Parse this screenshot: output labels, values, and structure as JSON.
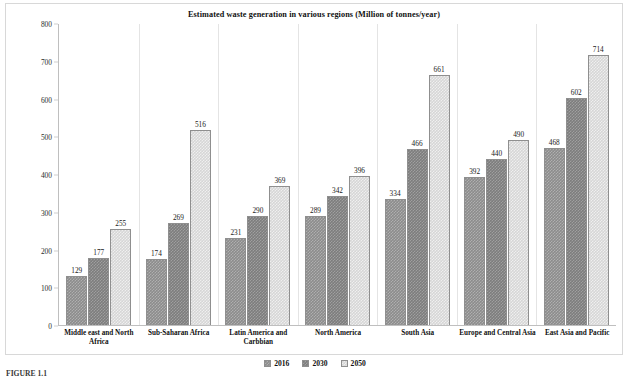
{
  "caption": "FIGURE 1.1",
  "legend": {
    "position": "bottom-center",
    "entries": [
      {
        "label": "2016",
        "color": "#8c8c8c"
      },
      {
        "label": "2030",
        "color": "#7d7d7d"
      },
      {
        "label": "2050",
        "color": "#d6d6d6"
      }
    ]
  },
  "chart_data": {
    "type": "bar",
    "title": "Estimated waste generation in various regions (Million of tonnes/year)",
    "xlabel": "",
    "ylabel": "Million of tonnes/year",
    "ylim": [
      0,
      800
    ],
    "yticks": [
      0,
      100,
      200,
      300,
      400,
      500,
      600,
      700,
      800
    ],
    "grid": false,
    "categories": [
      "Middle east and North Africa",
      "Sub-Saharan Africa",
      "Latin America and Carbbian",
      "North America",
      "South Asia",
      "Europe and Central Asia",
      "East Asia and Pacific"
    ],
    "series": [
      {
        "name": "2016",
        "values": [
          129,
          174,
          231,
          289,
          334,
          392,
          468
        ]
      },
      {
        "name": "2030",
        "values": [
          177,
          269,
          290,
          342,
          466,
          440,
          602
        ]
      },
      {
        "name": "2050",
        "values": [
          255,
          516,
          369,
          396,
          661,
          490,
          714
        ]
      }
    ]
  }
}
